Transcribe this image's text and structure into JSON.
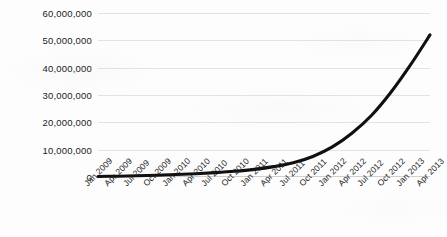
{
  "chart_data": {
    "type": "line",
    "title": "",
    "subtitle": "",
    "xlabel": "",
    "ylabel": "",
    "grid": true,
    "legend": false,
    "legend_position": "none",
    "line_color": "#101010",
    "gridline_color": "#e3e3e3",
    "background_color": "#fdfdfd",
    "ylim": [
      0,
      60000000
    ],
    "y_ticks": [
      0,
      10000000,
      20000000,
      30000000,
      40000000,
      50000000,
      60000000
    ],
    "y_tick_labels": [
      "0",
      "10,000,000",
      "20,000,000",
      "30,000,000",
      "40,000,000",
      "50,000,000",
      "60,000,000"
    ],
    "categories": [
      "Jan 2009",
      "Apr 2009",
      "Jul 2009",
      "Oct 2009",
      "Jan 2010",
      "Apr 2010",
      "Jul 2010",
      "Oct 2010",
      "Jan 2011",
      "Apr 2011",
      "Jul 2011",
      "Oct 2011",
      "Jan 2012",
      "Apr 2012",
      "Jul 2012",
      "Oct 2012",
      "Jan 2013",
      "Apr 2013"
    ],
    "values": [
      200000,
      300000,
      450000,
      650000,
      900000,
      1200000,
      1600000,
      2100000,
      2800000,
      3800000,
      5200000,
      7500000,
      11000000,
      16000000,
      22500000,
      31000000,
      41000000,
      52000000
    ],
    "series": [
      {
        "name": "",
        "values": [
          200000,
          300000,
          450000,
          650000,
          900000,
          1200000,
          1600000,
          2100000,
          2800000,
          3800000,
          5200000,
          7500000,
          11000000,
          16000000,
          22500000,
          31000000,
          41000000,
          52000000
        ]
      }
    ]
  }
}
